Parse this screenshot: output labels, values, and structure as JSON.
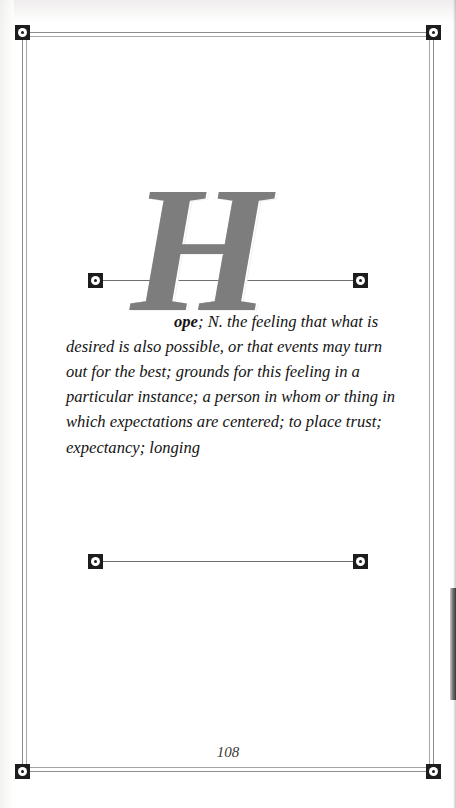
{
  "page": {
    "kind": "dictionary-entry-page",
    "folio": "108",
    "background_color": "#ffffff",
    "ink_color": "#131313"
  },
  "frame": {
    "border_color": "#8d8d8d",
    "inner_border_color": "#a6a6a6",
    "corner_markers": [
      {
        "name": "top-left",
        "icon": "square-ring-dot-marker"
      },
      {
        "name": "top-right",
        "icon": "square-ring-dot-marker"
      },
      {
        "name": "bottom-left",
        "icon": "square-ring-dot-marker"
      },
      {
        "name": "bottom-right",
        "icon": "square-ring-dot-marker"
      }
    ]
  },
  "rules": [
    {
      "name": "upper-rule",
      "left_marker_icon": "square-ring-dot-marker",
      "right_marker_icon": "square-ring-dot-marker",
      "line_color": "#6f6f6f"
    },
    {
      "name": "lower-rule",
      "left_marker_icon": "square-ring-dot-marker",
      "right_marker_icon": "square-ring-dot-marker",
      "line_color": "#6f6f6f"
    }
  ],
  "entry": {
    "dropcap": "H",
    "dropcap_color": "#7d7d7d",
    "headword_remainder": "ope",
    "part_of_speech": "; N.",
    "definition": " the feeling that what is desired is also possible, or that events may turn out for the best; grounds for this feeling in a particular instance; a person in whom or thing in which expectations are centered; to place trust; expectancy; longing",
    "full_headword": "Hope"
  }
}
